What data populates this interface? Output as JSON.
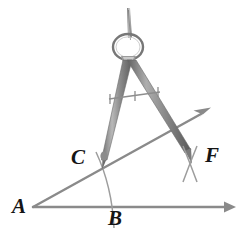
{
  "figure": {
    "background_color": "#ffffff",
    "line_color": "#8a8a8a",
    "arc_color": "#9a9a9a",
    "compass_color": "#a0a0a0",
    "compass_dark_color": "#6e6e6e",
    "label_color": "#151515"
  },
  "labels": {
    "A": "A",
    "B": "B",
    "C": "C",
    "F": "F"
  },
  "icons": {
    "compass": "compass-icon",
    "ray_arrow": "arrow-head-icon",
    "arc": "arc-icon",
    "tick_mark": "tick-mark-icon",
    "intersection_cross": "cross-mark-icon"
  },
  "geometry": {
    "vertex": "A",
    "points": [
      {
        "name": "A",
        "x": 33,
        "y": 207
      },
      {
        "name": "B",
        "x": 116,
        "y": 216
      },
      {
        "name": "C",
        "x": 99,
        "y": 164
      },
      {
        "name": "F",
        "x": 193,
        "y": 163
      }
    ],
    "rays": [
      {
        "name": "ray-AB",
        "from": "A",
        "to_x": 233,
        "to_y": 207,
        "arrow": true
      },
      {
        "name": "ray-AC",
        "from": "A",
        "to_x": 209,
        "to_y": 109,
        "arrow": true
      }
    ],
    "arcs": [
      {
        "name": "arc-CB",
        "description": "arc centered at A through C and B"
      },
      {
        "name": "arc-F-cross",
        "description": "intersecting arc marks at F"
      }
    ],
    "compass": {
      "hinge_x": 128,
      "hinge_y": 48,
      "needle_x": 101,
      "needle_y": 166,
      "pencil_x": 190,
      "pencil_y": 158,
      "width_marks": 3
    }
  }
}
